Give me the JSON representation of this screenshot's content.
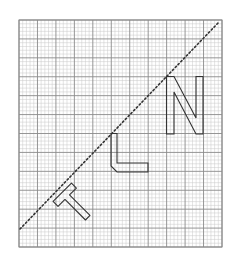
{
  "diagram": {
    "title": "Letters T, L, N on graph paper with diagonal dotted line",
    "grid": {
      "major_columns": 11,
      "major_rows": 12,
      "subdivisions": 5,
      "minor_color": "#c8c8c8",
      "major_color": "#8a8a8a"
    },
    "line": {
      "style": "dotted",
      "color": "#333333",
      "label": "diagonal-line"
    },
    "shapes": [
      {
        "id": "letter-t",
        "letter": "T",
        "outline_color": "#333333",
        "rotation": "45° clockwise tilt"
      },
      {
        "id": "letter-l",
        "letter": "L",
        "outline_color": "#333333"
      },
      {
        "id": "letter-n",
        "letter": "N",
        "outline_color": "#333333"
      }
    ]
  }
}
